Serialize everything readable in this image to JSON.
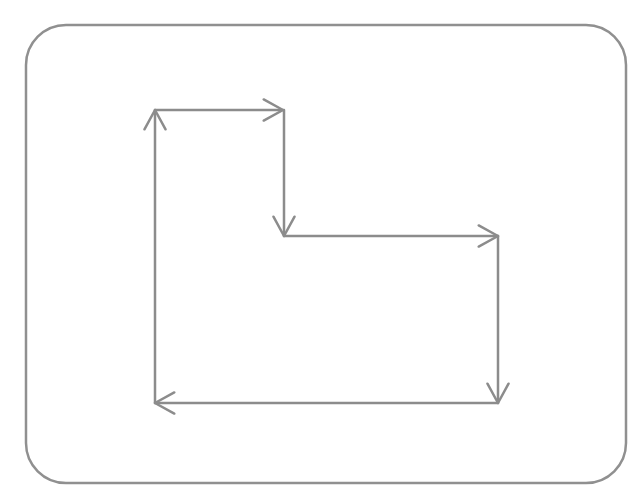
{
  "diagram": {
    "title": "",
    "stroke_color": "#8c8c8c",
    "frame_color": "#909090",
    "background": "#ffffff",
    "frame": {
      "x": 26,
      "y": 25,
      "width": 600,
      "height": 458,
      "radius": 40
    },
    "path_shape": "L-shaped rectilinear path (clockwise)",
    "arrows": [
      {
        "id": "up-left",
        "from": [
          155,
          403
        ],
        "to": [
          155,
          110
        ],
        "direction": "up"
      },
      {
        "id": "right-top",
        "from": [
          155,
          110
        ],
        "to": [
          283,
          110
        ],
        "direction": "right"
      },
      {
        "id": "down-step",
        "from": [
          284,
          110
        ],
        "to": [
          284,
          236
        ],
        "direction": "down"
      },
      {
        "id": "right-step",
        "from": [
          284,
          236
        ],
        "to": [
          498,
          236
        ],
        "direction": "right"
      },
      {
        "id": "down-right",
        "from": [
          498,
          236
        ],
        "to": [
          498,
          403
        ],
        "direction": "down"
      },
      {
        "id": "left-bottom",
        "from": [
          498,
          403
        ],
        "to": [
          155,
          403
        ],
        "direction": "left"
      }
    ]
  }
}
